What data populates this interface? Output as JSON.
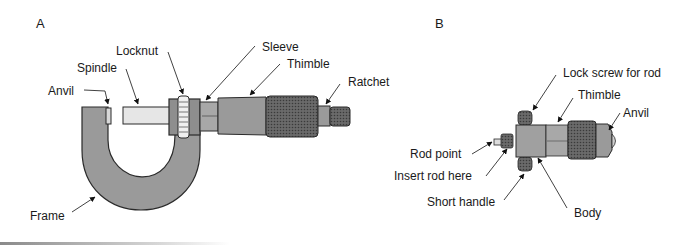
{
  "panels": {
    "a": {
      "label": "A",
      "title": "Outside micrometer",
      "parts": {
        "locknut": "Locknut",
        "sleeve": "Sleeve",
        "spindle": "Spindle",
        "thimble": "Thimble",
        "ratchet": "Ratchet",
        "anvil": "Anvil",
        "frame": "Frame"
      },
      "scale": {
        "sleeve_marks": "0 1",
        "thimble_5": "5",
        "thimble_10": "10"
      }
    },
    "b": {
      "label": "B",
      "title": "Inside micrometer",
      "parts": {
        "lock_screw": "Lock screw for rod",
        "thimble": "Thimble",
        "anvil": "Anvil",
        "rod_point": "Rod point",
        "insert_rod": "Insert rod here",
        "short_handle": "Short handle",
        "body": "Body"
      },
      "scale": {
        "sleeve_marks": "0 1",
        "thimble_5": "5",
        "thimble_10": "10"
      }
    }
  },
  "colors": {
    "metal": "#9a9a9a",
    "metal_dark": "#6e6e6e",
    "outline": "#2a2a2a",
    "knurl": "#555555",
    "text": "#1a1a1a"
  }
}
